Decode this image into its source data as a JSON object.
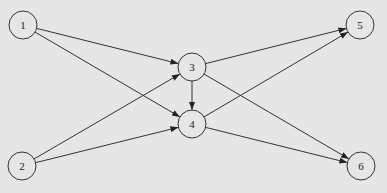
{
  "diagram": {
    "type": "directed-graph",
    "background": "#e6e6e6",
    "stroke": "#333333",
    "nodes": [
      {
        "id": "1",
        "label": "1",
        "x": 23,
        "y": 25
      },
      {
        "id": "2",
        "label": "2",
        "x": 22,
        "y": 166
      },
      {
        "id": "3",
        "label": "3",
        "x": 192,
        "y": 67
      },
      {
        "id": "4",
        "label": "4",
        "x": 192,
        "y": 124
      },
      {
        "id": "5",
        "label": "5",
        "x": 360,
        "y": 25
      },
      {
        "id": "6",
        "label": "6",
        "x": 361,
        "y": 166
      }
    ],
    "edges": [
      {
        "from": "1",
        "to": "3"
      },
      {
        "from": "1",
        "to": "4"
      },
      {
        "from": "2",
        "to": "3"
      },
      {
        "from": "2",
        "to": "4"
      },
      {
        "from": "3",
        "to": "4"
      },
      {
        "from": "3",
        "to": "5"
      },
      {
        "from": "3",
        "to": "6"
      },
      {
        "from": "4",
        "to": "5"
      },
      {
        "from": "4",
        "to": "6"
      }
    ]
  }
}
